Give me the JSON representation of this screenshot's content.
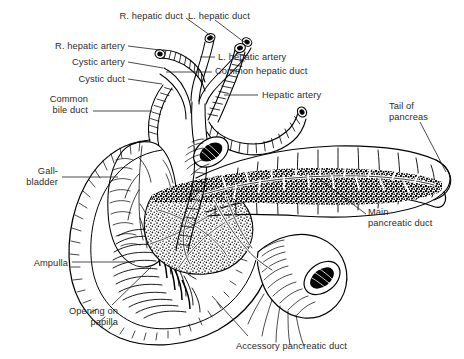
{
  "figure": {
    "type": "anatomical-illustration",
    "style": "pen-and-ink line drawing with stipple shading",
    "background_color": "#ffffff",
    "ink_color": "#000000",
    "label_color": "#2b2b2b"
  },
  "labels": [
    {
      "id": "r-hepatic-duct",
      "text": "R. hepatic duct",
      "align": "right",
      "x": 183,
      "y": 11,
      "leader": [
        [
          186,
          18
        ],
        [
          214,
          38
        ]
      ]
    },
    {
      "id": "l-hepatic-duct",
      "text": "L. hepatic duct",
      "align": "left",
      "x": 188,
      "y": 11,
      "leader": [
        [
          215,
          20
        ],
        [
          244,
          42
        ]
      ]
    },
    {
      "id": "r-hepatic-artery",
      "text": "R. hepatic artery",
      "align": "right",
      "x": 125,
      "y": 41,
      "leader": [
        [
          128,
          46
        ],
        [
          160,
          50
        ]
      ]
    },
    {
      "id": "cystic-artery",
      "text": "Cystic artery",
      "align": "right",
      "x": 125,
      "y": 57,
      "leader": [
        [
          128,
          62
        ],
        [
          163,
          68
        ]
      ]
    },
    {
      "id": "cystic-duct",
      "text": "Cystic duct",
      "align": "right",
      "x": 125,
      "y": 74,
      "leader": [
        [
          128,
          79
        ],
        [
          162,
          84
        ]
      ]
    },
    {
      "id": "common-bile-duct",
      "text": "Common\nbile duct",
      "align": "right",
      "x": 88,
      "y": 94,
      "leader": [
        [
          93,
          111
        ],
        [
          152,
          111
        ]
      ]
    },
    {
      "id": "l-hepatic-artery",
      "text": "L. hepatic artery",
      "align": "left",
      "x": 218,
      "y": 52,
      "leader": [
        [
          200,
          57
        ],
        [
          215,
          57
        ]
      ]
    },
    {
      "id": "common-hepatic-duct",
      "text": "Common hepatic duct",
      "align": "left",
      "x": 215,
      "y": 66,
      "leader": [
        [
          166,
          72
        ],
        [
          212,
          72
        ]
      ]
    },
    {
      "id": "hepatic-artery",
      "text": "Hepatic artery",
      "align": "left",
      "x": 262,
      "y": 90,
      "leader": [
        [
          224,
          95
        ],
        [
          258,
          95
        ]
      ]
    },
    {
      "id": "tail-of-pancreas",
      "text": "Tail of\npancreas",
      "align": "left",
      "x": 389,
      "y": 101,
      "leader": [
        [
          420,
          122
        ],
        [
          446,
          172
        ]
      ]
    },
    {
      "id": "gall-bladder",
      "text": "Gall-\nbladder",
      "align": "right",
      "x": 58,
      "y": 166,
      "leader": [
        [
          62,
          177
        ],
        [
          118,
          177
        ]
      ]
    },
    {
      "id": "main-pancreatic-duct",
      "text": "Main\npancreatic duct",
      "align": "left",
      "x": 368,
      "y": 207,
      "leader": [
        [
          366,
          214
        ],
        [
          318,
          178
        ]
      ]
    },
    {
      "id": "ampulla",
      "text": "Ampulla",
      "align": "right",
      "x": 68,
      "y": 258,
      "leader": [
        [
          72,
          262
        ],
        [
          135,
          262
        ]
      ]
    },
    {
      "id": "opening-on-papilla",
      "text": "Opening on\npapilla",
      "align": "right",
      "x": 118,
      "y": 306,
      "leader": [
        [
          112,
          305
        ],
        [
          151,
          267
        ]
      ]
    },
    {
      "id": "accessory-pancreatic-duct",
      "text": "Accessory pancreatic duct",
      "align": "left",
      "x": 236,
      "y": 341,
      "leader": [
        [
          248,
          336
        ],
        [
          212,
          296
        ]
      ]
    }
  ],
  "structures": [
    "right hepatic duct",
    "left hepatic duct",
    "common hepatic duct",
    "right hepatic artery",
    "left hepatic artery",
    "hepatic artery",
    "cystic artery",
    "cystic duct",
    "common bile duct",
    "gallbladder",
    "duodenum",
    "ampulla of Vater",
    "opening on papilla",
    "head of pancreas",
    "body of pancreas",
    "tail of pancreas",
    "main pancreatic duct",
    "accessory pancreatic duct",
    "cut jejunum"
  ]
}
